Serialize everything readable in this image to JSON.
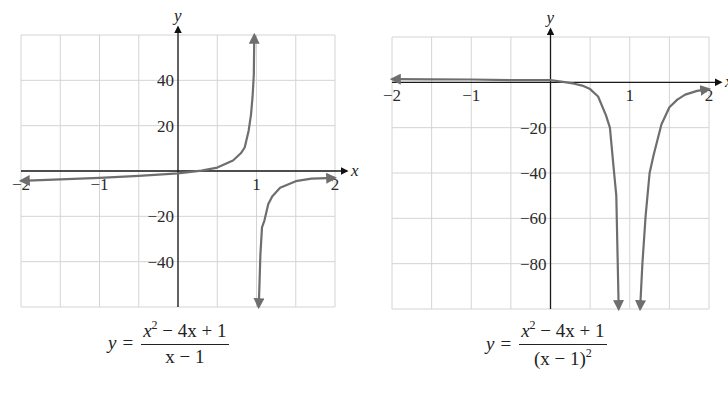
{
  "chart_data": [
    {
      "type": "line",
      "title": "y = (x^2 - 4x + 1)/(x - 1)",
      "caption": {
        "lhs": "y",
        "eq": "=",
        "num_a": "x",
        "num_exp": "2",
        "num_b": " − 4x + 1",
        "den": "x − 1"
      },
      "xlabel": "x",
      "ylabel": "y",
      "xlim": [
        -2,
        2
      ],
      "ylim": [
        -60,
        60
      ],
      "x_ticks": [
        -2,
        -1,
        1,
        2
      ],
      "x_tick_labels": [
        "−2",
        "−1",
        "1",
        "2"
      ],
      "y_ticks": [
        40,
        20,
        -20,
        -40
      ],
      "y_tick_labels": [
        "40",
        "20",
        "−20",
        "−40"
      ],
      "grid": true,
      "grid_x_step": 0.5,
      "grid_y_step": 20,
      "vertical_asymptote": 1,
      "series": [
        {
          "name": "left branch",
          "x": [
            -2,
            -1.5,
            -1,
            -0.5,
            0,
            0.3,
            0.5,
            0.7,
            0.8,
            0.85,
            0.9,
            0.93,
            0.95,
            0.965,
            0.972
          ],
          "y": [
            -4.33,
            -3.7,
            -3.0,
            -2.17,
            -1.0,
            0.13,
            1.5,
            4.63,
            7.8,
            10.37,
            17.9,
            24.9,
            33.0,
            42.5,
            60.0
          ]
        },
        {
          "name": "right branch",
          "x": [
            1.028,
            1.035,
            1.05,
            1.07,
            1.1,
            1.15,
            1.2,
            1.3,
            1.5,
            1.7,
            2
          ],
          "y": [
            -60.0,
            -53.8,
            -36.9,
            -24.9,
            -21.9,
            -14.6,
            -11.2,
            -7.4,
            -4.5,
            -3.4,
            -3.0
          ]
        }
      ]
    },
    {
      "type": "line",
      "title": "y = (x^2 - 4x + 1)/(x - 1)^2",
      "caption": {
        "lhs": "y",
        "eq": "=",
        "num_a": "x",
        "num_exp": "2",
        "num_b": " − 4x + 1",
        "den_a": "(x − 1)",
        "den_exp": "2"
      },
      "xlabel": "x",
      "ylabel": "y",
      "xlim": [
        -2,
        2
      ],
      "ylim": [
        -100,
        20
      ],
      "x_ticks": [
        -2,
        -1,
        1,
        2
      ],
      "x_tick_labels": [
        "−2",
        "−1",
        "1",
        "2"
      ],
      "y_ticks": [
        -20,
        -40,
        -60,
        -80
      ],
      "y_tick_labels": [
        "−20",
        "−40",
        "−60",
        "−80"
      ],
      "grid": true,
      "grid_x_step": 0.5,
      "grid_y_step": 20,
      "vertical_asymptote": 1,
      "series": [
        {
          "name": "left branch",
          "x": [
            -2,
            -1.5,
            -1,
            -0.5,
            0,
            0.2,
            0.3,
            0.4,
            0.5,
            0.6,
            0.7,
            0.75,
            0.8,
            0.83,
            0.86
          ],
          "y": [
            1.44,
            1.36,
            1.25,
            1.0,
            1.0,
            0.0,
            -0.6,
            -1.42,
            -3.0,
            -6.25,
            -14.6,
            -20.0,
            -39.0,
            -50.0,
            -100.0
          ]
        },
        {
          "name": "right branch",
          "x": [
            1.13,
            1.16,
            1.2,
            1.25,
            1.3,
            1.4,
            1.5,
            1.6,
            1.7,
            1.85,
            2
          ],
          "y": [
            -100.0,
            -80.0,
            -59.0,
            -40.0,
            -32.3,
            -18.6,
            -11.0,
            -7.6,
            -5.4,
            -3.8,
            -3.0
          ]
        }
      ]
    }
  ]
}
